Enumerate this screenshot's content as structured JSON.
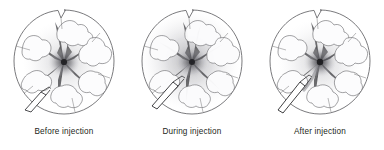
{
  "figure": {
    "background_color": "#ffffff",
    "panel_count": 3
  },
  "palette": {
    "outline": "#6b6b6e",
    "lobule_fill": "#fbfbfc",
    "lobule_stroke": "#58585b",
    "vessel_dark": "#4a4a4f",
    "vessel_darker": "#2f2f33",
    "diffuse_gray": "#b9b9bd",
    "needle_stroke": "#2a2a2d",
    "needle_fill": "#ffffff",
    "caption_color": "#231f20"
  },
  "panels": [
    {
      "id": "panel-before",
      "caption": "Before injection",
      "stage": "before",
      "needle_position": "lower-left",
      "needle_tip_contact": false,
      "center_density": "compact",
      "diffuse_spread": 0.15,
      "radiating_arms": 6
    },
    {
      "id": "panel-during",
      "caption": "During injection",
      "stage": "during",
      "needle_position": "lower-left",
      "needle_tip_contact": true,
      "center_density": "diffuse",
      "diffuse_spread": 0.85,
      "radiating_arms": 6
    },
    {
      "id": "panel-after",
      "caption": "After injection",
      "stage": "after",
      "needle_position": "lower-left",
      "needle_tip_contact": true,
      "center_density": "compact",
      "diffuse_spread": 0.3,
      "radiating_arms": 6
    }
  ]
}
